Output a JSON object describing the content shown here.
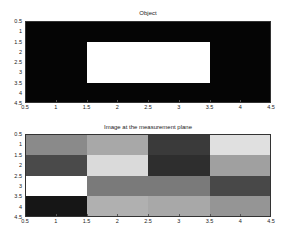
{
  "chart_data": [
    {
      "type": "heatmap",
      "title": "Object",
      "xlabel": "",
      "ylabel": "",
      "xlim": [
        0.5,
        4.5
      ],
      "ylim": [
        0.5,
        4.5
      ],
      "y_reversed": true,
      "x_ticks": [
        "0.5",
        "1",
        "1.5",
        "2",
        "2.5",
        "3",
        "3.5",
        "4",
        "4.5"
      ],
      "y_ticks": [
        "0.5",
        "1",
        "1.5",
        "2",
        "2.5",
        "3",
        "3.5",
        "4",
        "4.5"
      ],
      "colormap": "gray",
      "values": [
        [
          0,
          0,
          0,
          0
        ],
        [
          0,
          1,
          1,
          0
        ],
        [
          0,
          1,
          1,
          0
        ],
        [
          0,
          0,
          0,
          0
        ]
      ],
      "cell_colors": [
        [
          "#050505",
          "#050505",
          "#050505",
          "#050505"
        ],
        [
          "#050505",
          "#ffffff",
          "#ffffff",
          "#050505"
        ],
        [
          "#050505",
          "#ffffff",
          "#ffffff",
          "#050505"
        ],
        [
          "#050505",
          "#050505",
          "#050505",
          "#050505"
        ]
      ],
      "grid": false
    },
    {
      "type": "heatmap",
      "title": "Image at the measurement plane",
      "xlabel": "",
      "ylabel": "",
      "xlim": [
        0.5,
        4.5
      ],
      "ylim": [
        0.5,
        4.5
      ],
      "y_reversed": true,
      "x_ticks": [
        "0.5",
        "1",
        "1.5",
        "2",
        "2.5",
        "3",
        "3.5",
        "4",
        "4.5"
      ],
      "y_ticks": [
        "0.5",
        "1",
        "1.5",
        "2",
        "2.5",
        "3",
        "3.5",
        "4",
        "4.5"
      ],
      "colormap": "gray",
      "values": [
        [
          0.54,
          0.66,
          0.23,
          0.88
        ],
        [
          0.29,
          0.85,
          0.18,
          0.63
        ],
        [
          1.0,
          0.48,
          0.48,
          0.28
        ],
        [
          0.09,
          0.69,
          0.66,
          0.58
        ]
      ],
      "cell_colors": [
        [
          "#8a8a8a",
          "#a8a8a8",
          "#3a3a3a",
          "#e0e0e0"
        ],
        [
          "#4a4a4a",
          "#dadada",
          "#2e2e2e",
          "#a0a0a0"
        ],
        [
          "#ffffff",
          "#7a7a7a",
          "#7a7a7a",
          "#484848"
        ],
        [
          "#161616",
          "#b0b0b0",
          "#a8a8a8",
          "#959595"
        ]
      ],
      "grid": false
    }
  ]
}
